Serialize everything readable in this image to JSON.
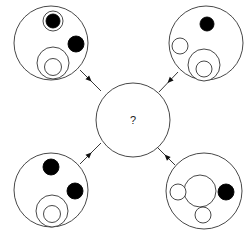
{
  "puzzle": {
    "question_mark": "?",
    "center": {
      "cx": 133,
      "cy": 120,
      "r": 37
    },
    "stroke_color": "#333333",
    "fill_color": "#000000",
    "panels": [
      {
        "name": "top-left",
        "outer": {
          "cx": 51,
          "cy": 43,
          "r": 37
        },
        "elements": [
          {
            "type": "open",
            "cx": 53,
            "cy": 21,
            "r": 10
          },
          {
            "type": "filled",
            "cx": 53,
            "cy": 21,
            "r": 7
          },
          {
            "type": "filled",
            "cx": 76,
            "cy": 44,
            "r": 8
          },
          {
            "type": "open",
            "cx": 53,
            "cy": 63,
            "r": 16
          },
          {
            "type": "open",
            "cx": 53,
            "cy": 67,
            "r": 8.5
          }
        ],
        "arrow": {
          "x1": 80,
          "y1": 70,
          "x2": 101,
          "y2": 91
        }
      },
      {
        "name": "top-right",
        "outer": {
          "cx": 206,
          "cy": 43,
          "r": 37
        },
        "elements": [
          {
            "type": "filled",
            "cx": 207,
            "cy": 24,
            "r": 7
          },
          {
            "type": "open",
            "cx": 180,
            "cy": 46,
            "r": 8
          },
          {
            "type": "open",
            "cx": 204,
            "cy": 65,
            "r": 16
          },
          {
            "type": "open",
            "cx": 204,
            "cy": 69,
            "r": 8
          }
        ],
        "arrow": {
          "x1": 178,
          "y1": 72,
          "x2": 159,
          "y2": 92
        }
      },
      {
        "name": "bottom-left",
        "outer": {
          "cx": 51,
          "cy": 190,
          "r": 37
        },
        "elements": [
          {
            "type": "filled",
            "cx": 51,
            "cy": 167,
            "r": 8
          },
          {
            "type": "filled",
            "cx": 75,
            "cy": 191,
            "r": 8
          },
          {
            "type": "open",
            "cx": 52,
            "cy": 211,
            "r": 16
          },
          {
            "type": "open",
            "cx": 52,
            "cy": 214,
            "r": 8.5
          }
        ],
        "arrow": {
          "x1": 80,
          "y1": 164,
          "x2": 101,
          "y2": 143
        }
      },
      {
        "name": "bottom-right",
        "outer": {
          "cx": 204,
          "cy": 191,
          "r": 38
        },
        "elements": [
          {
            "type": "open",
            "cx": 200,
            "cy": 191,
            "r": 16
          },
          {
            "type": "open",
            "cx": 178,
            "cy": 192,
            "r": 8
          },
          {
            "type": "filled",
            "cx": 226,
            "cy": 192,
            "r": 8
          },
          {
            "type": "open",
            "cx": 203,
            "cy": 215,
            "r": 8
          }
        ],
        "arrow": {
          "x1": 175,
          "y1": 165,
          "x2": 156,
          "y2": 146
        }
      }
    ]
  }
}
